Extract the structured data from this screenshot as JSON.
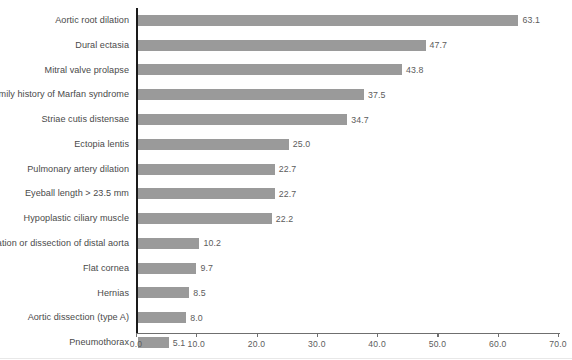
{
  "chart_data": {
    "type": "bar",
    "orientation": "horizontal",
    "title": "",
    "subtitle": "",
    "xlabel": "",
    "ylabel": "",
    "xlim": [
      0.0,
      70.0
    ],
    "xticks": [
      "0.0",
      "10.0",
      "20.0",
      "30.0",
      "40.0",
      "50.0",
      "60.0",
      "70.0"
    ],
    "xtick_values": [
      0,
      10,
      20,
      30,
      40,
      50,
      60,
      70
    ],
    "grid": false,
    "legend": false,
    "bar_color": "#9a9a9a",
    "axis_color": "#1a1a1a",
    "text_color": "#4a4a4a",
    "categories": [
      "Aortic root dilation",
      "Dural ectasia",
      "Mitral valve prolapse",
      "Family history of Marfan syndrome",
      "Striae cutis distensae",
      "Ectopia lentis",
      "Pulmonary artery dilation",
      "Eyeball length > 23.5 mm",
      "Hypoplastic ciliary muscle",
      "Dilation or dissection of distal aorta",
      "Flat cornea",
      "Hernias",
      "Aortic dissection (type A)",
      "Pneumothorax"
    ],
    "values": [
      63.1,
      47.7,
      43.8,
      37.5,
      34.7,
      25.0,
      22.7,
      22.7,
      22.2,
      10.2,
      9.7,
      8.5,
      8.0,
      5.1
    ],
    "value_labels": [
      "63.1",
      "47.7",
      "43.8",
      "37.5",
      "34.7",
      "25.0",
      "22.7",
      "22.7",
      "22.2",
      "10.2",
      "9.7",
      "8.5",
      "8.0",
      "5.1"
    ]
  }
}
